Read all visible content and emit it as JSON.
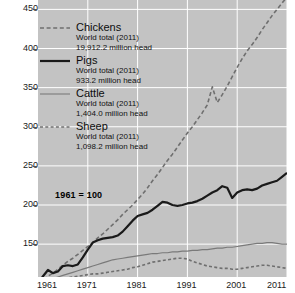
{
  "chart_data": {
    "type": "line",
    "title": "",
    "subtitle": "",
    "xlabel": "",
    "ylabel": "",
    "index_base_note": "1961 = 100",
    "grid": true,
    "legend_position": "upper-left-inside",
    "xlim": [
      1961,
      2011
    ],
    "ylim": [
      108,
      462
    ],
    "xticks": [
      1961,
      1971,
      1981,
      1991,
      2001,
      2011
    ],
    "yticks": [
      150,
      200,
      250,
      300,
      350,
      400,
      450
    ],
    "x": [
      1961,
      1962,
      1963,
      1964,
      1965,
      1966,
      1967,
      1968,
      1969,
      1970,
      1971,
      1972,
      1973,
      1974,
      1975,
      1976,
      1977,
      1978,
      1979,
      1980,
      1981,
      1982,
      1983,
      1984,
      1985,
      1986,
      1987,
      1988,
      1989,
      1990,
      1991,
      1992,
      1993,
      1994,
      1995,
      1996,
      1997,
      1998,
      1999,
      2000,
      2001,
      2002,
      2003,
      2004,
      2005,
      2006,
      2007,
      2008,
      2009,
      2010,
      2011
    ],
    "series": [
      {
        "name": "Chickens",
        "style": "dashed",
        "color": "#6f6f6f",
        "width": 1.6,
        "world_total_label": "World total (2011)",
        "world_total_value": "19,912.2   million head",
        "values": [
          100,
          104,
          109,
          113,
          118,
          123,
          128,
          132,
          137,
          142,
          147,
          152,
          158,
          163,
          169,
          175,
          181,
          188,
          194,
          200,
          207,
          214,
          222,
          231,
          239,
          248,
          257,
          265,
          274,
          283,
          292,
          300,
          309,
          318,
          328,
          351,
          331,
          341,
          352,
          364,
          376,
          387,
          397,
          405,
          414,
          424,
          433,
          442,
          450,
          458,
          466
        ]
      },
      {
        "name": "Pigs",
        "style": "solid",
        "color": "#1a1a1a",
        "width": 2.2,
        "world_total_label": "World total (2011)",
        "world_total_value": "933.2 million head",
        "values": [
          100,
          109,
          117,
          113,
          115,
          122,
          123,
          122,
          124,
          133,
          143,
          152,
          155,
          157,
          158,
          159,
          161,
          166,
          173,
          180,
          186,
          188,
          190,
          194,
          199,
          204,
          203,
          200,
          199,
          200,
          202,
          203,
          205,
          208,
          212,
          216,
          219,
          224,
          222,
          209,
          216,
          219,
          220,
          219,
          221,
          225,
          227,
          229,
          231,
          236,
          241
        ]
      },
      {
        "name": "Cattle",
        "style": "solid",
        "color": "#7a7a7a",
        "width": 1.2,
        "world_total_label": "World total (2011)",
        "world_total_value": "1,404.0 million head",
        "values": [
          100,
          102,
          104,
          106,
          108,
          110,
          112,
          114,
          116,
          118,
          120,
          122,
          124,
          126,
          128,
          130,
          131,
          132,
          133,
          134,
          135,
          136,
          137,
          138,
          138,
          139,
          139,
          140,
          140,
          141,
          141,
          142,
          142,
          143,
          143,
          144,
          145,
          145,
          146,
          146,
          147,
          148,
          149,
          150,
          151,
          151,
          152,
          152,
          151,
          150,
          150
        ]
      },
      {
        "name": "Sheep",
        "style": "dashed",
        "color": "#6f6f6f",
        "width": 1.6,
        "world_total_label": "World total (2011)",
        "world_total_value": "1,098.2 million head",
        "values": [
          100,
          101,
          103,
          104,
          105,
          106,
          107,
          108,
          109,
          110,
          111,
          112,
          112,
          113,
          114,
          115,
          116,
          117,
          118,
          120,
          121,
          123,
          125,
          127,
          128,
          129,
          130,
          131,
          132,
          132,
          131,
          128,
          126,
          124,
          122,
          121,
          120,
          119,
          119,
          118,
          118,
          119,
          120,
          121,
          122,
          123,
          123,
          122,
          121,
          120,
          119
        ]
      }
    ]
  },
  "axes": {
    "y_tick_labels": [
      "450",
      "400",
      "350",
      "300",
      "250",
      "200",
      "150"
    ],
    "x_tick_labels": [
      "1961",
      "1971",
      "1981",
      "1991",
      "2001",
      "2011"
    ]
  },
  "legend": {
    "items": [
      {
        "name": "Chickens",
        "total_label": "World total (2011)",
        "total_value": "19,912.2   million head"
      },
      {
        "name": "Pigs",
        "total_label": "World total (2011)",
        "total_value": "933.2 million head"
      },
      {
        "name": "Cattle",
        "total_label": "World total (2011)",
        "total_value": "1,404.0 million head"
      },
      {
        "name": "Sheep",
        "total_label": "World total (2011)",
        "total_value": "1,098.2 million head"
      }
    ]
  },
  "annotations": {
    "base_note": "1961 = 100"
  },
  "colors": {
    "plot_background": "#c3c3c3",
    "gridline": "#ffffff",
    "chickens": "#6f6f6f",
    "pigs": "#1a1a1a",
    "cattle": "#7a7a7a",
    "sheep": "#6f6f6f",
    "text": "#111111"
  }
}
